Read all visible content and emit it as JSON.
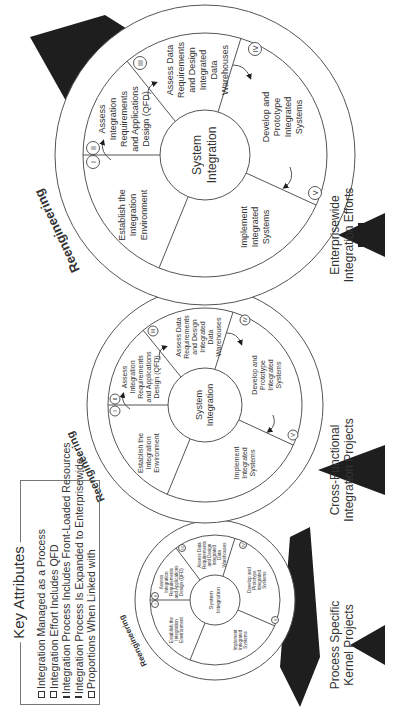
{
  "key_attributes": {
    "title": "Key Attributes",
    "items": [
      "Integration Managed as a Process",
      "Integration Effort Includes QFD",
      "Integration Process Includes Front-Loaded Resources",
      "Integration Process Is Expanded to Enterprisewide",
      "Proportions When Linked with"
    ]
  },
  "cycles": [
    {
      "id": "small",
      "ring_label": "Reengineering",
      "hub": [
        "System",
        "Integration"
      ],
      "phases": {
        "I_II": [
          "Establish the",
          "Integration",
          "Environment"
        ],
        "ii": [
          "Assess",
          "Integration",
          "Requirements",
          "and Applications",
          "Design (QFD)"
        ],
        "iii": [
          "Assess Data",
          "Requirements",
          "and Design",
          "Integrated",
          "Data",
          "Warehouses"
        ],
        "iv": [
          "Develop and",
          "Prototype",
          "Integrated",
          "Systems"
        ],
        "v": [
          "Implement",
          "Integrated",
          "Systems"
        ]
      }
    },
    {
      "id": "medium",
      "ring_label": "Reengineering",
      "hub": [
        "System",
        "Integration"
      ]
    },
    {
      "id": "large",
      "ring_label": "Reengineering",
      "hub": [
        "System",
        "Integration"
      ]
    }
  ],
  "phase_text": {
    "establish": [
      "Establish the",
      "Integration",
      "Environment"
    ],
    "assess_integration": [
      "Assess",
      "Integration",
      "Requirements",
      "and Applications",
      "Design (QFD)"
    ],
    "assess_data": [
      "Assess Data",
      "Requirements",
      "and Design",
      "Integrated",
      "Data",
      "Warehouses"
    ],
    "develop": [
      "Develop and",
      "Prototype",
      "Integrated",
      "Systems"
    ],
    "implement": [
      "Implement",
      "Integrated",
      "Systems"
    ],
    "hub": [
      "System",
      "Integration"
    ],
    "ring": "Reengineering"
  },
  "roman": [
    "I",
    "II",
    "III",
    "IV",
    "V"
  ],
  "scope_labels": {
    "process": [
      "Process Specific",
      "Kernel Projects"
    ],
    "cross": [
      "Cross-Functional",
      "Integration Projects"
    ],
    "enterprise": [
      "Enterprisewide",
      "Integration Efforts"
    ]
  },
  "colors": {
    "ink": "#1e1e1e",
    "line": "#555555",
    "text": "#333333",
    "background": "#ffffff"
  }
}
